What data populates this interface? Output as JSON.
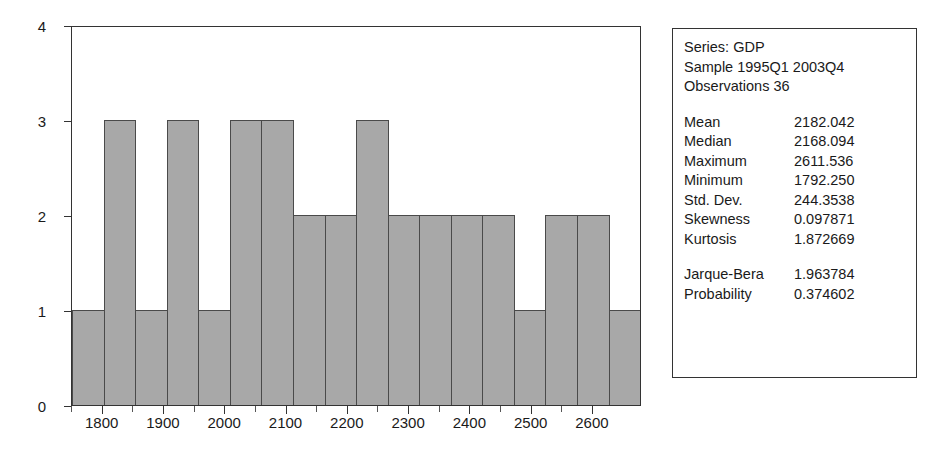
{
  "chart_data": {
    "type": "bar",
    "title": "",
    "subtitle": "",
    "xlabel": "",
    "ylabel": "",
    "grid": false,
    "legend": "none",
    "xlim": [
      1750,
      2680
    ],
    "ylim": [
      0,
      4
    ],
    "bin_width": 50,
    "x_ticks": [
      1800,
      1900,
      2000,
      2100,
      2200,
      2300,
      2400,
      2500,
      2600
    ],
    "x_tick_labels": [
      "1800",
      "1900",
      "2000",
      "2100",
      "2200",
      "2300",
      "2400",
      "2500",
      "2600"
    ],
    "y_ticks": [
      0,
      1,
      2,
      3,
      4
    ],
    "y_tick_labels": [
      "0",
      "1",
      "2",
      "3",
      "4"
    ],
    "bin_starts": [
      1750,
      1800,
      1850,
      1900,
      1950,
      2000,
      2050,
      2100,
      2150,
      2200,
      2250,
      2300,
      2350,
      2400,
      2450,
      2500,
      2550,
      2600
    ],
    "categories": [
      "1750-1800",
      "1800-1850",
      "1850-1900",
      "1900-1950",
      "1950-2000",
      "2000-2050",
      "2050-2100",
      "2100-2150",
      "2150-2200",
      "2200-2250",
      "2250-2300",
      "2300-2350",
      "2350-2400",
      "2400-2450",
      "2450-2500",
      "2500-2550",
      "2550-2600",
      "2600-2650"
    ],
    "values": [
      1,
      3,
      1,
      3,
      1,
      3,
      3,
      2,
      2,
      3,
      2,
      2,
      2,
      2,
      1,
      2,
      2,
      1
    ],
    "bar_color": "#a8a8a8",
    "bar_edge_color": "#4a4a4a"
  },
  "stats": {
    "header": {
      "series_line": "Series: GDP",
      "sample_line": "Sample 1995Q1 2003Q4",
      "observations_line": "Observations 36"
    },
    "rows": [
      {
        "key": "Mean",
        "value": "2182.042"
      },
      {
        "key": "Median",
        "value": "2168.094"
      },
      {
        "key": "Maximum",
        "value": "2611.536"
      },
      {
        "key": "Minimum",
        "value": "1792.250"
      },
      {
        "key": "Std. Dev.",
        "value": "244.3538"
      },
      {
        "key": "Skewness",
        "value": "0.097871"
      },
      {
        "key": "Kurtosis",
        "value": "1.872669"
      }
    ],
    "tests": [
      {
        "key": "Jarque-Bera",
        "value": "1.963784"
      },
      {
        "key": "Probability",
        "value": "0.374602"
      }
    ]
  }
}
